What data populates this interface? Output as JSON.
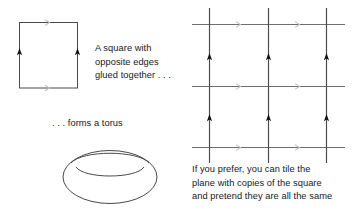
{
  "figure": {
    "background_color": "#ffffff",
    "stroke_color": "#3a3a3a",
    "arrow_color": "#111111",
    "faint_marker_color": "#b9b9b9",
    "text_color": "#16191c"
  },
  "captions": {
    "square": {
      "line1": "A square with",
      "line2": "opposite edges",
      "line3": "glued together . . ."
    },
    "torus": {
      "line1": ". . . forms a torus"
    },
    "tiling": {
      "line1": "If you prefer, you can tile the",
      "line2": "plane with copies of the square",
      "line3": "and pretend they are all the same"
    }
  },
  "diagrams": {
    "square": {
      "name": "glued-square",
      "left": 19,
      "top": 22,
      "right": 78,
      "bottom": 88,
      "edge_markers": {
        "left_edge": "single-up-arrow",
        "right_edge": "single-up-arrow",
        "top_edge": "faint-right-chevron",
        "bottom_edge": "faint-right-chevron"
      }
    },
    "torus": {
      "name": "torus-outline",
      "center_x": 110,
      "center_y": 176,
      "outer_rx": 47,
      "outer_ry": 27,
      "hole_rx": 27,
      "hole_ry": 9
    },
    "tiling_grid": {
      "name": "tiled-plane-grid",
      "vertical_lines_x": [
        209,
        268,
        326
      ],
      "horizontal_lines_y": [
        24,
        86,
        147
      ],
      "vertical_extent": [
        8,
        162
      ],
      "horizontal_extent": [
        192,
        345
      ],
      "vertical_arrow_rows_y": [
        58,
        119
      ],
      "horizontal_marker_cols_x": [
        238,
        297
      ],
      "vertical_count": 3,
      "horizontal_count": 3
    }
  }
}
